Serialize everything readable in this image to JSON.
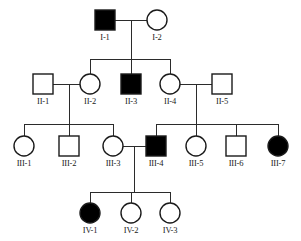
{
  "figure": {
    "kind": "pedigree-chart",
    "width": 301,
    "height": 241,
    "background_color": "#ffffff",
    "line_color": "#2b2b2b",
    "symbol_stroke_color": "#1a1a1a",
    "affected_fill_color": "#000000",
    "unaffected_fill_color": "#ffffff"
  },
  "legend_semantics": {
    "square": "male",
    "circle": "female",
    "filled": "affected",
    "open": "unaffected"
  },
  "generations": [
    {
      "id": "I",
      "label": "I"
    },
    {
      "id": "II",
      "label": "II"
    },
    {
      "id": "III",
      "label": "III"
    },
    {
      "id": "IV",
      "label": "IV"
    }
  ],
  "individuals": [
    {
      "id": "I-1",
      "label": "I-1",
      "sex": "male",
      "shape": "square",
      "affected": true,
      "fill": "#000000",
      "cx": 105,
      "cy": 20,
      "size": 20,
      "label_x": 105,
      "label_y": 32
    },
    {
      "id": "I-2",
      "label": "I-2",
      "sex": "female",
      "shape": "circle",
      "affected": false,
      "fill": "#ffffff",
      "cx": 157,
      "cy": 20,
      "size": 20,
      "label_x": 157,
      "label_y": 32
    },
    {
      "id": "II-1",
      "label": "II-1",
      "sex": "male",
      "shape": "square",
      "affected": false,
      "fill": "#ffffff",
      "cx": 43,
      "cy": 84,
      "size": 20,
      "label_x": 43,
      "label_y": 96
    },
    {
      "id": "II-2",
      "label": "II-2",
      "sex": "female",
      "shape": "circle",
      "affected": false,
      "fill": "#ffffff",
      "cx": 90,
      "cy": 84,
      "size": 20,
      "label_x": 90,
      "label_y": 96
    },
    {
      "id": "II-3",
      "label": "II-3",
      "sex": "male",
      "shape": "square",
      "affected": true,
      "fill": "#000000",
      "cx": 131,
      "cy": 84,
      "size": 20,
      "label_x": 131,
      "label_y": 96
    },
    {
      "id": "II-4",
      "label": "II-4",
      "sex": "female",
      "shape": "circle",
      "affected": false,
      "fill": "#ffffff",
      "cx": 170,
      "cy": 84,
      "size": 20,
      "label_x": 170,
      "label_y": 96
    },
    {
      "id": "II-5",
      "label": "II-5",
      "sex": "male",
      "shape": "square",
      "affected": false,
      "fill": "#ffffff",
      "cx": 222,
      "cy": 84,
      "size": 20,
      "label_x": 222,
      "label_y": 96
    },
    {
      "id": "III-1",
      "label": "III-1",
      "sex": "female",
      "shape": "circle",
      "affected": false,
      "fill": "#ffffff",
      "cx": 24,
      "cy": 146,
      "size": 20,
      "label_x": 24,
      "label_y": 158
    },
    {
      "id": "III-2",
      "label": "III-2",
      "sex": "male",
      "shape": "square",
      "affected": false,
      "fill": "#ffffff",
      "cx": 69,
      "cy": 146,
      "size": 20,
      "label_x": 69,
      "label_y": 158
    },
    {
      "id": "III-3",
      "label": "III-3",
      "sex": "female",
      "shape": "circle",
      "affected": false,
      "fill": "#ffffff",
      "cx": 113,
      "cy": 146,
      "size": 20,
      "label_x": 113,
      "label_y": 158
    },
    {
      "id": "III-4",
      "label": "III-4",
      "sex": "male",
      "shape": "square",
      "affected": true,
      "fill": "#000000",
      "cx": 156,
      "cy": 146,
      "size": 20,
      "label_x": 156,
      "label_y": 158
    },
    {
      "id": "III-5",
      "label": "III-5",
      "sex": "female",
      "shape": "circle",
      "affected": false,
      "fill": "#ffffff",
      "cx": 196,
      "cy": 146,
      "size": 20,
      "label_x": 196,
      "label_y": 158
    },
    {
      "id": "III-6",
      "label": "III-6",
      "sex": "male",
      "shape": "square",
      "affected": false,
      "fill": "#ffffff",
      "cx": 236,
      "cy": 146,
      "size": 20,
      "label_x": 236,
      "label_y": 158
    },
    {
      "id": "III-7",
      "label": "III-7",
      "sex": "female",
      "shape": "circle",
      "affected": true,
      "fill": "#000000",
      "cx": 278,
      "cy": 146,
      "size": 20,
      "label_x": 278,
      "label_y": 158
    },
    {
      "id": "IV-1",
      "label": "IV-1",
      "sex": "female",
      "shape": "circle",
      "affected": true,
      "fill": "#000000",
      "cx": 90,
      "cy": 213,
      "size": 20,
      "label_x": 90,
      "label_y": 225
    },
    {
      "id": "IV-2",
      "label": "IV-2",
      "sex": "female",
      "shape": "circle",
      "affected": false,
      "fill": "#ffffff",
      "cx": 131,
      "cy": 213,
      "size": 20,
      "label_x": 131,
      "label_y": 225
    },
    {
      "id": "IV-3",
      "label": "IV-3",
      "sex": "female",
      "shape": "circle",
      "affected": false,
      "fill": "#ffffff",
      "cx": 170,
      "cy": 213,
      "size": 20,
      "label_x": 170,
      "label_y": 225
    }
  ],
  "matings": [
    {
      "id": "mating-I1-I2",
      "partners": [
        "I-1",
        "I-2"
      ],
      "line": {
        "x1": 115,
        "y1": 20,
        "x2": 147,
        "y2": 20
      },
      "drop_x": 131
    },
    {
      "id": "mating-II1-II2",
      "partners": [
        "II-1",
        "II-2"
      ],
      "line": {
        "x1": 53,
        "y1": 84,
        "x2": 80,
        "y2": 84
      },
      "drop_x": 69
    },
    {
      "id": "mating-II4-II5",
      "partners": [
        "II-4",
        "II-5"
      ],
      "line": {
        "x1": 180,
        "y1": 84,
        "x2": 212,
        "y2": 84
      },
      "drop_x": 196
    },
    {
      "id": "mating-III3-III4",
      "partners": [
        "III-3",
        "III-4"
      ],
      "line": {
        "x1": 123,
        "y1": 146,
        "x2": 146,
        "y2": 146
      },
      "drop_x": 134
    }
  ],
  "sibships": [
    {
      "id": "sibship-gen2",
      "parent_mating": "mating-I1-I2",
      "children": [
        "II-2",
        "II-3",
        "II-4"
      ],
      "bar_y": 59,
      "bar_x1": 90,
      "bar_x2": 170,
      "drop_from_x": 131,
      "drop_from_y": 20,
      "child_top_y": 74
    },
    {
      "id": "sibship-gen3-left",
      "parent_mating": "mating-II1-II2",
      "children": [
        "III-1",
        "III-2",
        "III-3"
      ],
      "bar_y": 124,
      "bar_x1": 24,
      "bar_x2": 113,
      "drop_from_x": 69,
      "drop_from_y": 84,
      "child_top_y": 136
    },
    {
      "id": "sibship-gen3-right",
      "parent_mating": "mating-II4-II5",
      "children": [
        "III-4",
        "III-5",
        "III-6",
        "III-7"
      ],
      "bar_y": 124,
      "bar_x1": 156,
      "bar_x2": 278,
      "drop_from_x": 196,
      "drop_from_y": 84,
      "child_top_y": 136
    },
    {
      "id": "sibship-gen4",
      "parent_mating": "mating-III3-III4",
      "children": [
        "IV-1",
        "IV-2",
        "IV-3"
      ],
      "bar_y": 192,
      "bar_x1": 90,
      "bar_x2": 170,
      "drop_from_x": 134,
      "drop_from_y": 146,
      "child_top_y": 203
    }
  ],
  "counts": {
    "total_individuals": 17,
    "affected_individuals": 5,
    "affected_ids": [
      "I-1",
      "II-3",
      "III-4",
      "III-7",
      "IV-1"
    ],
    "generations": 4
  }
}
